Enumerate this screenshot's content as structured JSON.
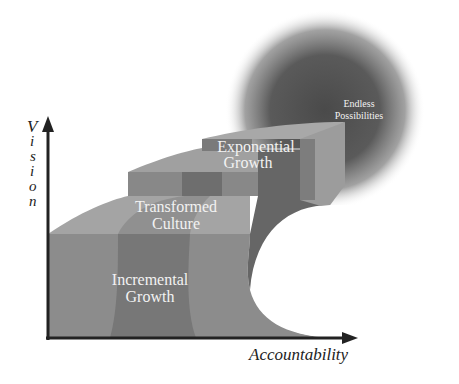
{
  "diagram": {
    "axes": {
      "y_label": "Vision",
      "y_label_letters": [
        "V",
        "i",
        "s",
        "i",
        "o",
        "n"
      ],
      "x_label": "Accountability"
    },
    "stages": [
      {
        "line1": "Incremental",
        "line2": "Growth"
      },
      {
        "line1": "Transformed",
        "line2": "Culture"
      },
      {
        "line1": "Exponential",
        "line2": "Growth"
      },
      {
        "line1": "Endless",
        "line2": "Possibilities"
      }
    ],
    "colors": {
      "axis": "#222222",
      "step_light": "#9a9a9a",
      "step_mid": "#858585",
      "step_dark": "#6e6e6e",
      "glow": "#555555",
      "text": "#f2f2f2"
    }
  }
}
